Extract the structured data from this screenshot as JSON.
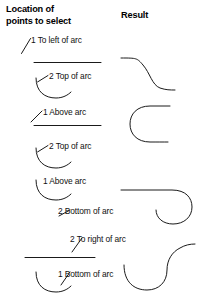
{
  "headers": {
    "location_column": "Location of\npoints to select",
    "result_column": "Result"
  },
  "rows": [
    {
      "id": "row-1",
      "point_1_label": "1 To left of arc",
      "point_2_label": "2 Top of arc",
      "result_shape": "s-curve-descending"
    },
    {
      "id": "row-2",
      "point_1_label": "1 Above arc",
      "point_2_label": "2 Top of arc",
      "result_shape": "c-shape-open-left"
    },
    {
      "id": "row-3",
      "point_1_label": "1 Above arc",
      "point_2_label": "2 Bottom of arc",
      "result_shape": "line-with-hook-loop"
    },
    {
      "id": "row-4",
      "point_2_right_label": "2 To right of arc",
      "point_1_label": "1 Bottom of arc",
      "result_shape": "u-curve-into-s-curve"
    }
  ],
  "colors": {
    "stroke": "#1a1a1a",
    "leader_stroke": "#333333",
    "text": "#111111",
    "background": "#ffffff"
  }
}
